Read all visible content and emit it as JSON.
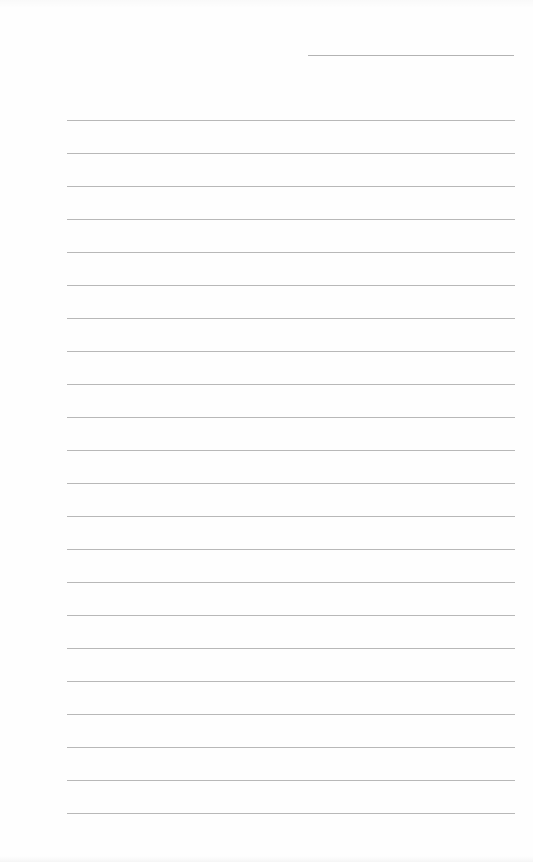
{
  "document": {
    "type": "lined-paper",
    "header_field": {
      "value": "",
      "top": 55,
      "left": 308,
      "width": 206
    },
    "ruled_lines": {
      "count": 22,
      "first_top": 120,
      "spacing": 33,
      "left": 67,
      "width": 448,
      "values": [
        "",
        "",
        "",
        "",
        "",
        "",
        "",
        "",
        "",
        "",
        "",
        "",
        "",
        "",
        "",
        "",
        "",
        "",
        "",
        "",
        "",
        ""
      ]
    },
    "colors": {
      "paper": "#fefefe",
      "line": "#9a9a9a"
    }
  }
}
